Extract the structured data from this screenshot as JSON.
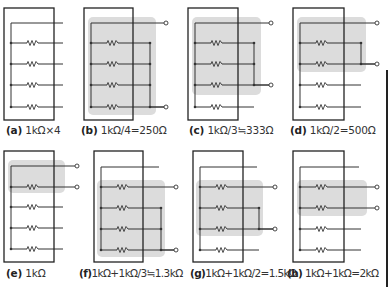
{
  "figure": {
    "colors": {
      "line": "#333333",
      "shade": "#dcdcdc",
      "box": "#222222",
      "terminal_fill": "#ffffff"
    },
    "panels": [
      {
        "id": "a",
        "label": "(a)",
        "caption": "1kΩ×4",
        "box": [
          4,
          8,
          50,
          112
        ],
        "bus_x": 11,
        "top_y": 23,
        "rows": [
          43,
          64,
          85,
          107
        ],
        "wire_end": 63,
        "shade": null,
        "right_bus": null,
        "terminals": [],
        "caption_pos": [
          6,
          124
        ]
      },
      {
        "id": "b",
        "label": "(b)",
        "caption": "1kΩ/4=250Ω",
        "box": [
          84,
          8,
          49,
          112
        ],
        "bus_x": 91,
        "top_y": 23,
        "rows": [
          43,
          64,
          85,
          107
        ],
        "wire_end": 150,
        "shade": [
          88,
          17,
          68,
          98
        ],
        "right_bus": [
          150,
          43,
          107
        ],
        "terminals": [
          [
            166,
            23
          ],
          [
            166,
            107
          ]
        ],
        "caption_pos": [
          81,
          124
        ]
      },
      {
        "id": "c",
        "label": "(c)",
        "caption": "1kΩ/3≒333Ω",
        "box": [
          188,
          8,
          50,
          112
        ],
        "bus_x": 195,
        "top_y": 23,
        "rows": [
          43,
          64,
          85,
          107
        ],
        "wire_end": 254,
        "shade": [
          192,
          17,
          69,
          78
        ],
        "right_bus": [
          254,
          43,
          85
        ],
        "terminals": [
          [
            271,
            23
          ],
          [
            271,
            85
          ]
        ],
        "caption_pos": [
          189,
          124
        ]
      },
      {
        "id": "d",
        "label": "(d)",
        "caption": "1kΩ/2=500Ω",
        "box": [
          293,
          8,
          51,
          112
        ],
        "bus_x": 300,
        "top_y": 23,
        "rows": [
          43,
          64,
          85,
          107
        ],
        "wire_end": 361,
        "shade": [
          297,
          17,
          69,
          55
        ],
        "right_bus": [
          361,
          43,
          64
        ],
        "terminals": [
          [
            377,
            23
          ],
          [
            377,
            64
          ]
        ],
        "caption_pos": [
          290,
          124
        ]
      },
      {
        "id": "e",
        "label": "(e)",
        "caption": "1kΩ",
        "box": [
          4,
          151,
          50,
          111
        ],
        "bus_x": 11,
        "top_y": 166,
        "rows": [
          187,
          207,
          228,
          249
        ],
        "wire_end": 63,
        "shade": [
          8,
          160,
          57,
          33
        ],
        "right_bus": null,
        "terminals": [
          [
            77,
            166
          ],
          [
            77,
            187
          ]
        ],
        "caption_pos": [
          6,
          267
        ]
      },
      {
        "id": "f",
        "label": "(f)",
        "caption": "1kΩ+1kΩ/3≒1.3kΩ",
        "box": [
          94,
          151,
          49,
          111
        ],
        "bus_x": 101,
        "top_y": 167,
        "rows": [
          187,
          208,
          229,
          250
        ],
        "wire_end": 161,
        "shade": [
          97,
          180,
          68,
          77
        ],
        "right_bus": [
          161,
          208,
          250
        ],
        "terminals": [
          [
            176,
            187
          ],
          [
            176,
            250
          ]
        ],
        "caption_pos": [
          79,
          267
        ]
      },
      {
        "id": "g",
        "label": "(g)",
        "caption": "1kΩ+1kΩ/2=1.5kΩ",
        "box": [
          193,
          151,
          50,
          111
        ],
        "bus_x": 200,
        "top_y": 167,
        "rows": [
          187,
          208,
          229,
          250
        ],
        "wire_end": 259,
        "shade": [
          196,
          180,
          67,
          56
        ],
        "right_bus": [
          259,
          208,
          229
        ],
        "terminals": [
          [
            275,
            187
          ],
          [
            275,
            229
          ]
        ],
        "caption_pos": [
          192,
          267
        ]
      },
      {
        "id": "h",
        "label": "(h)",
        "caption": "1kΩ+1kΩ=2kΩ",
        "box": [
          293,
          151,
          51,
          111
        ],
        "bus_x": 300,
        "top_y": 167,
        "rows": [
          187,
          208,
          229,
          250
        ],
        "wire_end": 361,
        "shade": [
          297,
          180,
          70,
          36
        ],
        "right_bus": null,
        "terminals": [
          [
            377,
            187
          ],
          [
            377,
            208
          ]
        ],
        "caption_pos": [
          287,
          267
        ]
      }
    ],
    "captions": {
      "a": {
        "label": "(a)",
        "text": "1kΩ×4"
      },
      "b": {
        "label": "(b)",
        "text": "1kΩ/4=250Ω"
      },
      "c": {
        "label": "(c)",
        "text": "1kΩ/3≒333Ω"
      },
      "d": {
        "label": "(d)",
        "text": "1kΩ/2=500Ω"
      },
      "e": {
        "label": "(e)",
        "text": "1kΩ"
      },
      "f": {
        "label": "(f)",
        "text": "1kΩ+1kΩ/3≒1.3kΩ"
      },
      "g": {
        "label": "(g)",
        "text": "1kΩ+1kΩ/2=1.5kΩ"
      },
      "h": {
        "label": "(h)",
        "text": "1kΩ+1kΩ=2kΩ"
      }
    },
    "component": "resistor-1k-ohm",
    "resistor_count_per_panel": 4
  }
}
